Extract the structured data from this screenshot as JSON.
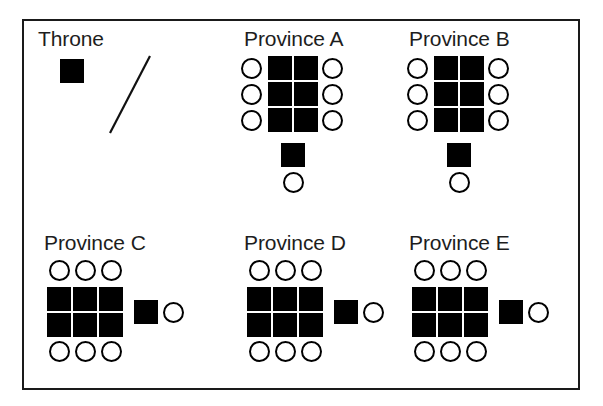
{
  "figure": {
    "kind": "schematic-diagram",
    "background_color": "#ffffff",
    "border_color": "#1a1a1a",
    "square_color": "#000000",
    "circle_stroke_color": "#000000",
    "label_color": "#1d1d1d"
  },
  "legend": {
    "title": "Throne",
    "square_symbol": "filled-square",
    "line_symbol": "diagonal-line"
  },
  "groups": [
    {
      "id": "throne",
      "label": "Throne",
      "label_x": 38,
      "label_y": 28,
      "layout": "legend",
      "squares": [
        {
          "x": 60,
          "y": 59
        }
      ],
      "circles": [],
      "line": {
        "x1": 110,
        "y1": 133,
        "x2": 150,
        "y2": 56
      }
    },
    {
      "id": "province-a",
      "label": "Province A",
      "label_x": 244,
      "label_y": 28,
      "layout": "vertical-3x2-with-tail",
      "squares": [
        {
          "x": 268,
          "y": 56
        },
        {
          "x": 294,
          "y": 56
        },
        {
          "x": 268,
          "y": 82
        },
        {
          "x": 294,
          "y": 82
        },
        {
          "x": 268,
          "y": 108
        },
        {
          "x": 294,
          "y": 108
        },
        {
          "x": 281,
          "y": 143
        }
      ],
      "circles": [
        {
          "x": 241,
          "y": 58
        },
        {
          "x": 322,
          "y": 58
        },
        {
          "x": 241,
          "y": 84
        },
        {
          "x": 322,
          "y": 84
        },
        {
          "x": 241,
          "y": 110
        },
        {
          "x": 322,
          "y": 110
        },
        {
          "x": 283,
          "y": 172
        }
      ]
    },
    {
      "id": "province-b",
      "label": "Province B",
      "label_x": 409,
      "label_y": 28,
      "layout": "vertical-3x2-with-tail",
      "squares": [
        {
          "x": 434,
          "y": 56
        },
        {
          "x": 460,
          "y": 56
        },
        {
          "x": 434,
          "y": 82
        },
        {
          "x": 460,
          "y": 82
        },
        {
          "x": 434,
          "y": 108
        },
        {
          "x": 460,
          "y": 108
        },
        {
          "x": 447,
          "y": 143
        }
      ],
      "circles": [
        {
          "x": 407,
          "y": 58
        },
        {
          "x": 488,
          "y": 58
        },
        {
          "x": 407,
          "y": 84
        },
        {
          "x": 488,
          "y": 84
        },
        {
          "x": 407,
          "y": 110
        },
        {
          "x": 488,
          "y": 110
        },
        {
          "x": 449,
          "y": 172
        }
      ]
    },
    {
      "id": "province-c",
      "label": "Province C",
      "label_x": 44,
      "label_y": 232,
      "layout": "horizontal-2x3-with-tail",
      "squares": [
        {
          "x": 47,
          "y": 287
        },
        {
          "x": 73,
          "y": 287
        },
        {
          "x": 99,
          "y": 287
        },
        {
          "x": 47,
          "y": 313
        },
        {
          "x": 73,
          "y": 313
        },
        {
          "x": 99,
          "y": 313
        },
        {
          "x": 134,
          "y": 300
        }
      ],
      "circles": [
        {
          "x": 49,
          "y": 260
        },
        {
          "x": 75,
          "y": 260
        },
        {
          "x": 101,
          "y": 260
        },
        {
          "x": 49,
          "y": 341
        },
        {
          "x": 75,
          "y": 341
        },
        {
          "x": 101,
          "y": 341
        },
        {
          "x": 163,
          "y": 302
        }
      ]
    },
    {
      "id": "province-d",
      "label": "Province D",
      "label_x": 244,
      "label_y": 232,
      "layout": "horizontal-2x3-with-tail",
      "squares": [
        {
          "x": 247,
          "y": 287
        },
        {
          "x": 273,
          "y": 287
        },
        {
          "x": 299,
          "y": 287
        },
        {
          "x": 247,
          "y": 313
        },
        {
          "x": 273,
          "y": 313
        },
        {
          "x": 299,
          "y": 313
        },
        {
          "x": 334,
          "y": 300
        }
      ],
      "circles": [
        {
          "x": 249,
          "y": 260
        },
        {
          "x": 275,
          "y": 260
        },
        {
          "x": 301,
          "y": 260
        },
        {
          "x": 249,
          "y": 341
        },
        {
          "x": 275,
          "y": 341
        },
        {
          "x": 301,
          "y": 341
        },
        {
          "x": 363,
          "y": 302
        }
      ]
    },
    {
      "id": "province-e",
      "label": "Province E",
      "label_x": 409,
      "label_y": 232,
      "layout": "horizontal-2x3-with-tail",
      "squares": [
        {
          "x": 412,
          "y": 287
        },
        {
          "x": 438,
          "y": 287
        },
        {
          "x": 464,
          "y": 287
        },
        {
          "x": 412,
          "y": 313
        },
        {
          "x": 438,
          "y": 313
        },
        {
          "x": 464,
          "y": 313
        },
        {
          "x": 499,
          "y": 300
        }
      ],
      "circles": [
        {
          "x": 414,
          "y": 260
        },
        {
          "x": 440,
          "y": 260
        },
        {
          "x": 466,
          "y": 260
        },
        {
          "x": 414,
          "y": 341
        },
        {
          "x": 440,
          "y": 341
        },
        {
          "x": 466,
          "y": 341
        },
        {
          "x": 528,
          "y": 302
        }
      ]
    }
  ],
  "counts": {
    "province_a_squares": 7,
    "province_a_circles": 7,
    "province_b_squares": 7,
    "province_b_circles": 7,
    "province_c_squares": 7,
    "province_c_circles": 7,
    "province_d_squares": 7,
    "province_d_circles": 7,
    "province_e_squares": 7,
    "province_e_circles": 7
  }
}
